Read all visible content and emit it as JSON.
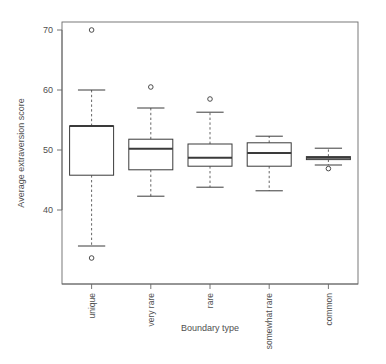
{
  "chart_data": {
    "type": "box",
    "title": "",
    "xlabel": "Boundary type",
    "ylabel": "Average extraversion score",
    "categories": [
      "unique",
      "very rare",
      "rare",
      "somewhat rare",
      "common"
    ],
    "ylim": [
      31,
      71.5
    ],
    "yticks": [
      40,
      50,
      60,
      70
    ],
    "ytick_labels": [
      "40",
      "50",
      "60",
      "70"
    ],
    "grid": false,
    "legend": "none",
    "boxes": [
      {
        "category": "unique",
        "whisker_low": 34.0,
        "q1": 45.8,
        "median": 54.0,
        "q3": 54.0,
        "whisker_high": 60.0,
        "outliers": [
          70.0,
          32.0
        ]
      },
      {
        "category": "very rare",
        "whisker_low": 42.3,
        "q1": 46.7,
        "median": 50.2,
        "q3": 51.8,
        "whisker_high": 57.0,
        "outliers": [
          60.5
        ]
      },
      {
        "category": "rare",
        "whisker_low": 43.8,
        "q1": 47.3,
        "median": 48.7,
        "q3": 51.0,
        "whisker_high": 56.3,
        "outliers": [
          58.5
        ]
      },
      {
        "category": "somewhat rare",
        "whisker_low": 43.2,
        "q1": 47.3,
        "median": 49.5,
        "q3": 51.2,
        "whisker_high": 52.3,
        "outliers": []
      },
      {
        "category": "common",
        "whisker_low": 47.5,
        "q1": 48.4,
        "median": 48.7,
        "q3": 48.9,
        "whisker_high": 50.3,
        "outliers": [
          46.9
        ]
      }
    ],
    "colors": {
      "line": "#3a3a3a",
      "box_fill": "#ffffff",
      "whisker": "#555555",
      "frame": "#666666",
      "text": "#4f4f4f",
      "background": "#ffffff"
    }
  },
  "axes": {
    "y_title": "Average extraversion score",
    "x_title": "Boundary type"
  }
}
